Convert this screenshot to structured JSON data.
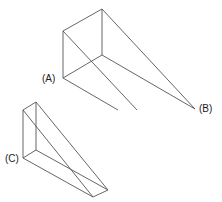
{
  "diagram": {
    "stroke_color": "#555555",
    "labels": [
      {
        "id": "A",
        "text": "(A)",
        "x": 42,
        "y": 82
      },
      {
        "id": "B",
        "text": "(B)",
        "x": 199,
        "y": 112
      },
      {
        "id": "C",
        "text": "(C)",
        "x": 5,
        "y": 162
      }
    ],
    "shapes": [
      {
        "name": "large-wedge",
        "edges": [
          [
            63,
            31,
            102,
            9
          ],
          [
            63,
            31,
            63,
            78
          ],
          [
            102,
            9,
            102,
            55
          ],
          [
            63,
            78,
            102,
            55
          ],
          [
            102,
            9,
            195,
            109
          ],
          [
            102,
            55,
            195,
            109
          ],
          [
            63,
            31,
            135,
            130
          ],
          [
            63,
            78,
            135,
            130
          ]
        ]
      },
      {
        "name": "small-wedge",
        "edges": [
          [
            23,
            110,
            36,
            102
          ],
          [
            23,
            110,
            23,
            158
          ],
          [
            36,
            102,
            36,
            150
          ],
          [
            23,
            158,
            36,
            150
          ],
          [
            36,
            102,
            108,
            190
          ],
          [
            36,
            150,
            108,
            190
          ],
          [
            23,
            110,
            93,
            197
          ],
          [
            23,
            158,
            93,
            197
          ],
          [
            93,
            197,
            108,
            190
          ]
        ]
      }
    ]
  }
}
